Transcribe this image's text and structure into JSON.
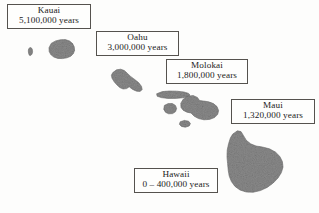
{
  "figure": {
    "kind": "map",
    "region": "Hawaiian Islands",
    "background_color": "#fdfdfc",
    "island_fill_color": "#8a8a8a",
    "island_edge_color": "#6d6d6d",
    "label_border_color": "#55524e",
    "label_text_color": "#1b1b1b"
  },
  "labels": [
    {
      "id": "kauai",
      "name": "Kauai",
      "age": "5,100,000 years"
    },
    {
      "id": "oahu",
      "name": "Oahu",
      "age": "3,000,000 years"
    },
    {
      "id": "molokai",
      "name": "Molokai",
      "age": "1,800,000 years"
    },
    {
      "id": "maui",
      "name": "Maui",
      "age": "1,320,000 years"
    },
    {
      "id": "hawaii",
      "name": "Hawaii",
      "age": "0 – 400,000 years"
    }
  ],
  "islands": [
    {
      "id": "niihau",
      "labeled": false
    },
    {
      "id": "kauai",
      "labeled": true
    },
    {
      "id": "oahu",
      "labeled": true
    },
    {
      "id": "molokai",
      "labeled": true
    },
    {
      "id": "lanai",
      "labeled": false
    },
    {
      "id": "maui",
      "labeled": true
    },
    {
      "id": "kahoolawe",
      "labeled": false
    },
    {
      "id": "big-island",
      "labeled": true
    }
  ]
}
